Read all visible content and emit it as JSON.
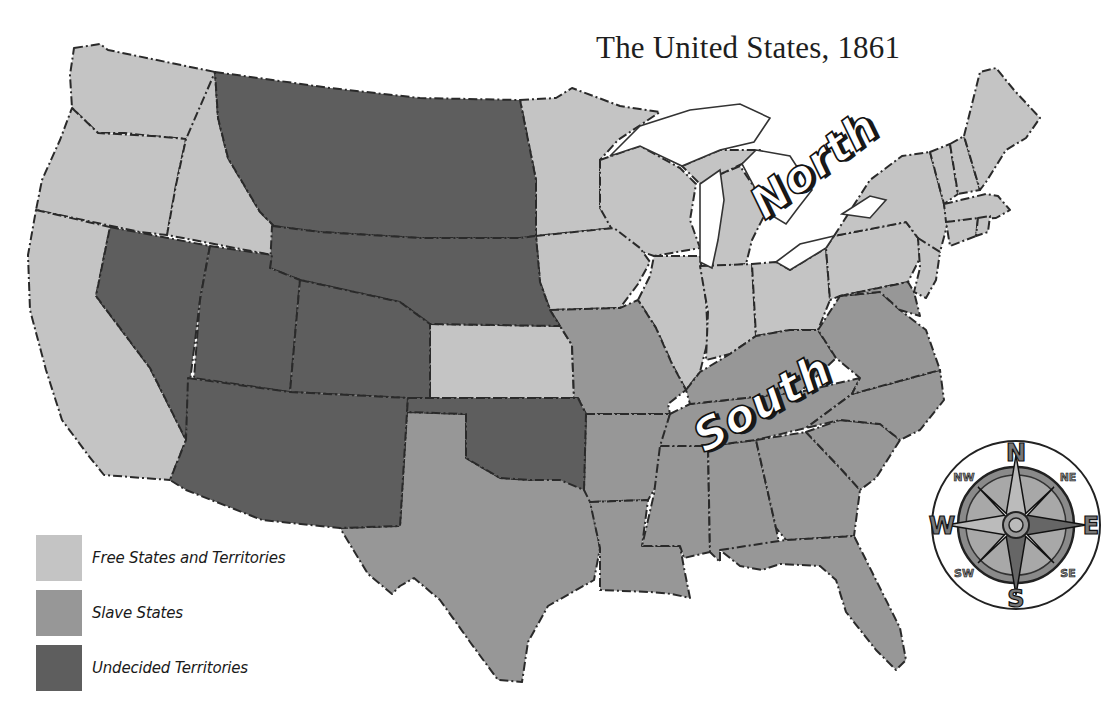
{
  "title": "The United States, 1861",
  "colors": {
    "free": "#c4c4c4",
    "slave": "#979797",
    "undecided": "#5e5e5e",
    "border": "#2a2a2a",
    "water": "#ffffff"
  },
  "legend": {
    "items": [
      {
        "label": "Free States and Territories",
        "category": "free"
      },
      {
        "label": "Slave States",
        "category": "slave"
      },
      {
        "label": "Undecided Territories",
        "category": "undecided"
      }
    ]
  },
  "region_labels": {
    "north": "North",
    "south": "South"
  },
  "compass": {
    "n": "N",
    "s": "S",
    "e": "E",
    "w": "W",
    "ne": "NE",
    "nw": "NW",
    "se": "SE",
    "sw": "SW"
  }
}
